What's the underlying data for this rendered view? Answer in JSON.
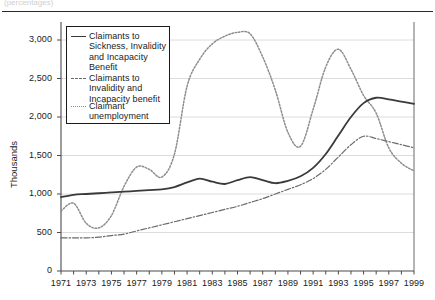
{
  "page": {
    "clipped_caption": "(percentages)"
  },
  "chart_data": {
    "type": "line",
    "title": "",
    "xlabel": "",
    "ylabel": "Thousands",
    "xlim": [
      1971,
      1999
    ],
    "ylim": [
      0,
      3000
    ],
    "yticks": [
      0,
      500,
      1000,
      1500,
      2000,
      2500,
      3000
    ],
    "ytick_labels": [
      "0",
      "500",
      "1,000",
      "1,500",
      "2,000",
      "2,500",
      "3,000"
    ],
    "xticks": [
      1971,
      1973,
      1975,
      1977,
      1979,
      1981,
      1983,
      1985,
      1987,
      1989,
      1991,
      1993,
      1995,
      1997,
      1999
    ],
    "xtick_labels": [
      "1971",
      "1973",
      "1975",
      "1977",
      "1979",
      "1981",
      "1983",
      "1985",
      "1987",
      "1989",
      "1991",
      "1993",
      "1995",
      "1997",
      "1999"
    ],
    "xtick_minor_step": 1,
    "grid": "horizontal",
    "legend_position": "upper-left-inside",
    "x": [
      1971,
      1972,
      1973,
      1974,
      1975,
      1976,
      1977,
      1978,
      1979,
      1980,
      1981,
      1982,
      1983,
      1984,
      1985,
      1986,
      1987,
      1988,
      1989,
      1990,
      1991,
      1992,
      1993,
      1994,
      1995,
      1996,
      1997,
      1998,
      1999
    ],
    "series": [
      {
        "name": "Claimants to Sickness, Invalidity and Incapacity Benefit",
        "style": "solid",
        "color": "#3a3a3a",
        "width": 1.8,
        "values": [
          960,
          990,
          1000,
          1010,
          1020,
          1030,
          1040,
          1050,
          1060,
          1090,
          1150,
          1200,
          1160,
          1130,
          1180,
          1220,
          1180,
          1140,
          1170,
          1230,
          1340,
          1520,
          1760,
          2000,
          2180,
          2250,
          2230,
          2200,
          2170
        ]
      },
      {
        "name": "Claimants to Invalidity and Incapacity benefit",
        "style": "dashdot",
        "color": "#6a6a6a",
        "width": 1.2,
        "values": [
          430,
          430,
          430,
          440,
          460,
          480,
          520,
          560,
          600,
          640,
          680,
          720,
          760,
          800,
          840,
          890,
          940,
          1000,
          1060,
          1120,
          1200,
          1320,
          1480,
          1640,
          1750,
          1720,
          1680,
          1640,
          1600
        ]
      },
      {
        "name": "Claimant unemployment",
        "style": "dotted",
        "color": "#8d8d8d",
        "width": 1.5,
        "values": [
          780,
          880,
          620,
          560,
          720,
          1100,
          1350,
          1320,
          1220,
          1520,
          2400,
          2750,
          2950,
          3050,
          3100,
          3080,
          2780,
          2350,
          1800,
          1620,
          2100,
          2650,
          2880,
          2620,
          2280,
          2050,
          1600,
          1400,
          1300
        ]
      }
    ],
    "annotations": []
  }
}
